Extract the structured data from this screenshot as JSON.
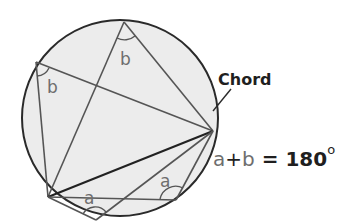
{
  "diagram": {
    "chord_label": "Chord",
    "angle_labels": {
      "top": "b",
      "left": "b",
      "bottom_left": "a",
      "bottom_right": "a"
    },
    "formula": {
      "a": "a",
      "plus": "+",
      "b": "b",
      "equals": " = ",
      "value": "180",
      "unit": "o"
    },
    "colors": {
      "circle_fill": "#ececec",
      "circle_stroke": "#2a2a2a",
      "line": "#555555",
      "chord": "#222222",
      "text_dark": "#1f1f1f",
      "text_gray": "#6e6e6e"
    }
  }
}
